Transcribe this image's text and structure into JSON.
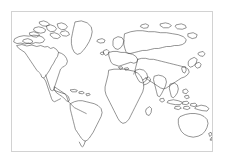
{
  "figure": {
    "kind": "world-map-outline",
    "title": "",
    "has_labels": false,
    "has_legend": false,
    "has_graticule": false,
    "projection": "equirectangular"
  },
  "colors": {
    "background": "#ffffff",
    "frame_border": "#d2d2d2",
    "coastline_stroke": "#3c3c3c"
  },
  "frame": {
    "x": 11,
    "y": 11,
    "width": 202,
    "height": 141
  },
  "landmasses": [
    {
      "name": "north-america",
      "label": ""
    },
    {
      "name": "greenland",
      "label": ""
    },
    {
      "name": "canadian-arctic-archipelago",
      "label": ""
    },
    {
      "name": "central-america",
      "label": ""
    },
    {
      "name": "caribbean-islands",
      "label": ""
    },
    {
      "name": "south-america",
      "label": ""
    },
    {
      "name": "iceland",
      "label": ""
    },
    {
      "name": "british-isles",
      "label": ""
    },
    {
      "name": "scandinavia",
      "label": ""
    },
    {
      "name": "europe",
      "label": ""
    },
    {
      "name": "mediterranean-islands",
      "label": ""
    },
    {
      "name": "africa",
      "label": ""
    },
    {
      "name": "madagascar",
      "label": ""
    },
    {
      "name": "arabian-peninsula",
      "label": ""
    },
    {
      "name": "asia",
      "label": ""
    },
    {
      "name": "india",
      "label": ""
    },
    {
      "name": "sri-lanka",
      "label": ""
    },
    {
      "name": "siberia",
      "label": ""
    },
    {
      "name": "japan",
      "label": ""
    },
    {
      "name": "korea",
      "label": ""
    },
    {
      "name": "southeast-asia",
      "label": ""
    },
    {
      "name": "indonesia",
      "label": ""
    },
    {
      "name": "philippines",
      "label": ""
    },
    {
      "name": "new-guinea",
      "label": ""
    },
    {
      "name": "australia",
      "label": ""
    },
    {
      "name": "new-zealand",
      "label": ""
    }
  ],
  "chart_data": {
    "type": "map",
    "title": "",
    "xlabel": "",
    "ylabel": "",
    "grid": false,
    "legend": "none",
    "categories": [
      "north-america",
      "greenland",
      "south-america",
      "africa",
      "europe",
      "asia",
      "australia",
      "islands"
    ]
  }
}
